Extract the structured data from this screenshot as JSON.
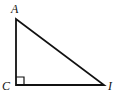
{
  "diagram": {
    "type": "right-triangle",
    "vertices": [
      {
        "label": "A",
        "x": 16,
        "y": 19
      },
      {
        "label": "C",
        "x": 16,
        "y": 85
      },
      {
        "label": "I",
        "x": 104,
        "y": 85
      }
    ],
    "right_angle_at": "C",
    "colors": {
      "stroke": "#111111",
      "background": "#ffffff"
    }
  }
}
